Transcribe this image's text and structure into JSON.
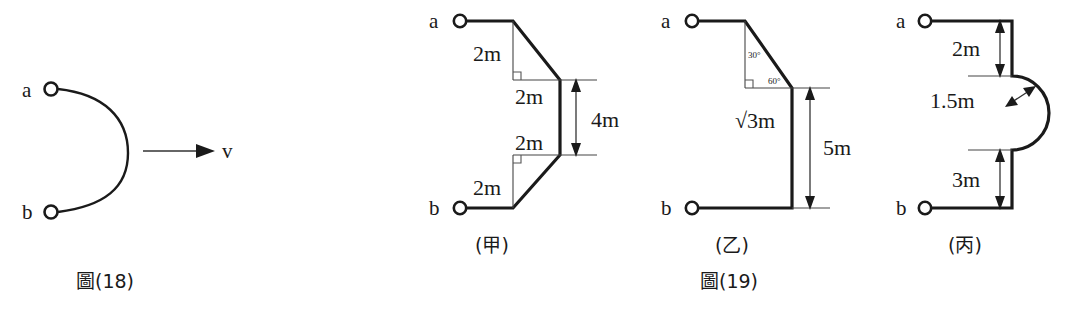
{
  "page": {
    "background": "#ffffff",
    "ink": "#1a1a1a",
    "width": 1085,
    "height": 332
  },
  "figures": [
    {
      "id": "fig18",
      "caption": "圖(18)",
      "terminal_top": "a",
      "terminal_bottom": "b",
      "velocity_label": "v",
      "shape": "semicircular-arc-bulging-right",
      "notes_visible": []
    },
    {
      "id": "fig19",
      "caption": "圖(19)",
      "panels": [
        {
          "id": "panel-jia",
          "caption": "(甲)",
          "terminal_top": "a",
          "terminal_bottom": "b",
          "dimensions": [
            {
              "name": "top-vertical-leg",
              "label": "2m"
            },
            {
              "name": "top-horizontal-leg",
              "label": "2m"
            },
            {
              "name": "bottom-horizontal-leg",
              "label": "2m"
            },
            {
              "name": "bottom-vertical-leg",
              "label": "2m"
            },
            {
              "name": "middle-vertical-span",
              "label": "4m"
            }
          ],
          "right_angle_markers": 2
        },
        {
          "id": "panel-yi",
          "caption": "(乙)",
          "terminal_top": "a",
          "terminal_bottom": "b",
          "dimensions": [
            {
              "name": "vertical-conductor",
              "label": "√3m"
            },
            {
              "name": "overall-vertical-span",
              "label": "5m"
            }
          ],
          "angles": [
            {
              "name": "upper-angle",
              "label": "30°"
            },
            {
              "name": "lower-angle",
              "label": "60°"
            }
          ],
          "right_angle_markers": 1
        },
        {
          "id": "panel-bing",
          "caption": "(丙)",
          "terminal_top": "a",
          "terminal_bottom": "b",
          "dimensions": [
            {
              "name": "top-segment",
              "label": "2m"
            },
            {
              "name": "arc-radius",
              "label": "1.5m"
            },
            {
              "name": "bottom-segment",
              "label": "3m"
            }
          ],
          "shape": "semicircular-bulge-right"
        }
      ]
    }
  ]
}
